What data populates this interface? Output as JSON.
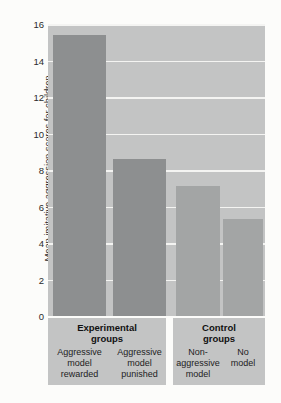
{
  "chart_data": {
    "type": "bar",
    "title": "",
    "subtitle": "",
    "xlabel": "",
    "ylabel": "Mean imitative aggression scores for children",
    "ylim": [
      0,
      16
    ],
    "ytick_labels": [
      "16",
      "14",
      "12",
      "10",
      "8",
      "6",
      "4",
      "2",
      "0"
    ],
    "yticks": [
      16,
      14,
      12,
      10,
      8,
      6,
      4,
      2,
      0
    ],
    "grid": "horizontal",
    "legend": "none",
    "categories": [
      "Aggressive model rewarded",
      "Aggressive model punished",
      "Non-aggressive model",
      "No model"
    ],
    "values": [
      15.4,
      8.6,
      7.1,
      5.3
    ],
    "bar_colors": [
      "#8d8f90",
      "#8d8f90",
      "#a3a5a5",
      "#a3a5a5"
    ],
    "groups": [
      {
        "name": "Experimental groups",
        "title_line1": "Experimental",
        "title_line2": "groups",
        "categories": [
          {
            "line1": "Aggressive",
            "line2": "model",
            "line3": "rewarded",
            "value": 15.4
          },
          {
            "line1": "Aggressive",
            "line2": "model",
            "line3": "punished",
            "value": 8.6
          }
        ]
      },
      {
        "name": "Control groups",
        "title_line1": "Control",
        "title_line2": "groups",
        "categories": [
          {
            "line1": "Non-",
            "line2": "aggressive",
            "line3": "model",
            "value": 7.1
          },
          {
            "line1": "No",
            "line2": "model",
            "line3": "",
            "value": 5.3
          }
        ]
      }
    ],
    "colors": {
      "plot_background": "#c3c4c4",
      "gridline": "#f4f4f2",
      "bar_experimental": "#8d8f90",
      "bar_control": "#a3a5a5",
      "label_band": "#c3c4c4",
      "text": "#222222",
      "page_background": "#fcfcfa"
    }
  }
}
